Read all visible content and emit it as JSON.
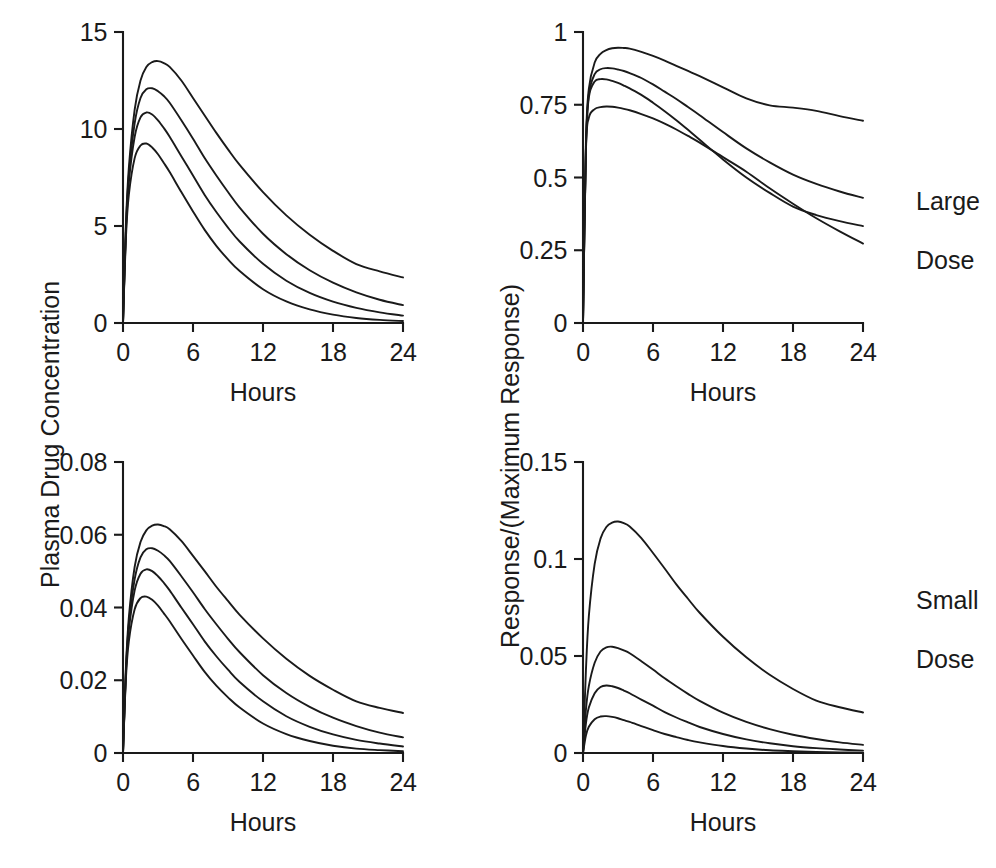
{
  "figure": {
    "background": "#ffffff",
    "ink_color": "#1a1a1a",
    "left_axis_title": "Plasma Drug Concentration",
    "right_axis_title": "Response/(Maximum Response)",
    "row_labels": [
      {
        "line1": "Large",
        "line2": "Dose"
      },
      {
        "line1": "Small",
        "line2": "Dose"
      }
    ]
  },
  "chart_data": [
    {
      "id": "top-left",
      "type": "line",
      "title": "",
      "xlabel": "Hours",
      "ylabel": "Plasma Drug Concentration",
      "xlim": [
        0,
        24
      ],
      "ylim": [
        0,
        15
      ],
      "xticks": [
        0,
        6,
        12,
        18,
        24
      ],
      "xticklabels": [
        "0",
        "6",
        "12",
        "18",
        "24"
      ],
      "yticks": [
        0,
        5,
        10,
        15
      ],
      "yticklabels": [
        "0",
        "5",
        "10",
        "15"
      ],
      "grid": false,
      "legend": "none",
      "x": [
        0,
        0.25,
        0.5,
        1,
        1.5,
        2,
        2.5,
        3,
        3.5,
        4,
        5,
        6,
        7,
        8,
        9,
        10,
        12,
        14,
        16,
        18,
        20,
        22,
        24
      ],
      "series": [
        {
          "name": "slowest elimination",
          "values": [
            0,
            5.1,
            8.0,
            11.0,
            12.5,
            13.2,
            13.45,
            13.5,
            13.4,
            13.2,
            12.5,
            11.6,
            10.7,
            9.8,
            8.95,
            8.15,
            6.75,
            5.55,
            4.55,
            3.72,
            3.04,
            2.66,
            2.35
          ]
        },
        {
          "name": "slow elimination",
          "values": [
            0,
            4.9,
            7.6,
            10.3,
            11.6,
            12.05,
            12.1,
            11.95,
            11.7,
            11.35,
            10.45,
            9.5,
            8.5,
            7.6,
            6.75,
            5.95,
            4.6,
            3.55,
            2.72,
            2.08,
            1.58,
            1.2,
            0.92
          ]
        },
        {
          "name": "fast elimination",
          "values": [
            0,
            4.7,
            7.25,
            9.6,
            10.6,
            10.85,
            10.75,
            10.45,
            10.05,
            9.6,
            8.6,
            7.6,
            6.6,
            5.72,
            4.92,
            4.2,
            3.05,
            2.18,
            1.55,
            1.1,
            0.78,
            0.55,
            0.38
          ]
        },
        {
          "name": "fastest elimination",
          "values": [
            0,
            4.4,
            6.6,
            8.5,
            9.15,
            9.25,
            9.05,
            8.7,
            8.25,
            7.78,
            6.75,
            5.75,
            4.8,
            3.98,
            3.28,
            2.68,
            1.74,
            1.11,
            0.7,
            0.43,
            0.26,
            0.16,
            0.1
          ]
        }
      ]
    },
    {
      "id": "top-right",
      "type": "line",
      "title": "",
      "xlabel": "Hours",
      "ylabel": "Response/(Maximum Response)",
      "xlim": [
        0,
        24
      ],
      "ylim": [
        0,
        1
      ],
      "xticks": [
        0,
        6,
        12,
        18,
        24
      ],
      "xticklabels": [
        "0",
        "6",
        "12",
        "18",
        "24"
      ],
      "yticks": [
        0,
        0.25,
        0.5,
        0.75,
        1
      ],
      "yticklabels": [
        "0",
        "0.25",
        "0.5",
        "0.75",
        "1"
      ],
      "grid": false,
      "legend": "none",
      "row_label": "Large Dose",
      "x": [
        0,
        0.25,
        0.5,
        1,
        1.5,
        2,
        2.5,
        3,
        3.5,
        4,
        5,
        6,
        7,
        8,
        9,
        10,
        12,
        14,
        16,
        18,
        20,
        22,
        24
      ],
      "series": [
        {
          "name": "slowest elimination",
          "values": [
            0,
            0.62,
            0.805,
            0.895,
            0.925,
            0.938,
            0.944,
            0.946,
            0.945,
            0.943,
            0.932,
            0.918,
            0.902,
            0.884,
            0.866,
            0.848,
            0.81,
            0.772,
            0.748,
            0.74,
            0.729,
            0.711,
            0.695
          ]
        },
        {
          "name": "slow elimination",
          "values": [
            0,
            0.605,
            0.785,
            0.855,
            0.872,
            0.876,
            0.875,
            0.871,
            0.866,
            0.859,
            0.842,
            0.82,
            0.795,
            0.77,
            0.742,
            0.714,
            0.656,
            0.6,
            0.552,
            0.51,
            0.478,
            0.452,
            0.43
          ]
        },
        {
          "name": "fast elimination",
          "values": [
            0,
            0.6,
            0.775,
            0.83,
            0.838,
            0.837,
            0.832,
            0.825,
            0.816,
            0.806,
            0.784,
            0.757,
            0.728,
            0.697,
            0.664,
            0.63,
            0.562,
            0.5,
            0.447,
            0.4,
            0.371,
            0.35,
            0.333
          ]
        },
        {
          "name": "fastest elimination",
          "values": [
            0,
            0.59,
            0.705,
            0.735,
            0.742,
            0.744,
            0.743,
            0.74,
            0.736,
            0.731,
            0.718,
            0.703,
            0.685,
            0.665,
            0.643,
            0.62,
            0.57,
            0.52,
            0.463,
            0.41,
            0.36,
            0.315,
            0.273
          ]
        }
      ]
    },
    {
      "id": "bottom-left",
      "type": "line",
      "title": "",
      "xlabel": "Hours",
      "ylabel": "Plasma Drug Concentration",
      "xlim": [
        0,
        24
      ],
      "ylim": [
        0,
        0.08
      ],
      "xticks": [
        0,
        6,
        12,
        18,
        24
      ],
      "xticklabels": [
        "0",
        "6",
        "12",
        "18",
        "24"
      ],
      "yticks": [
        0,
        0.02,
        0.04,
        0.06,
        0.08
      ],
      "yticklabels": [
        "0",
        "0.02",
        "0.04",
        "0.06",
        "0.08"
      ],
      "grid": false,
      "legend": "none",
      "x": [
        0,
        0.25,
        0.5,
        1,
        1.5,
        2,
        2.5,
        3,
        3.5,
        4,
        5,
        6,
        7,
        8,
        9,
        10,
        12,
        14,
        16,
        18,
        20,
        22,
        24
      ],
      "series": [
        {
          "name": "slowest elimination",
          "values": [
            0,
            0.0235,
            0.0372,
            0.0512,
            0.058,
            0.0612,
            0.0625,
            0.0628,
            0.0624,
            0.0615,
            0.0583,
            0.0542,
            0.05,
            0.0457,
            0.0418,
            0.038,
            0.0315,
            0.0259,
            0.0212,
            0.0174,
            0.0142,
            0.0124,
            0.011
          ]
        },
        {
          "name": "slow elimination",
          "values": [
            0,
            0.0228,
            0.0354,
            0.0478,
            0.0538,
            0.056,
            0.0563,
            0.0556,
            0.0544,
            0.0528,
            0.0486,
            0.0442,
            0.0396,
            0.0354,
            0.0314,
            0.0277,
            0.0214,
            0.0165,
            0.0127,
            0.0097,
            0.0074,
            0.0056,
            0.0043
          ]
        },
        {
          "name": "fast elimination",
          "values": [
            0,
            0.0219,
            0.0337,
            0.0447,
            0.0493,
            0.0505,
            0.05,
            0.0486,
            0.0468,
            0.0447,
            0.04,
            0.0354,
            0.0307,
            0.0266,
            0.0229,
            0.0195,
            0.0142,
            0.0101,
            0.0072,
            0.0051,
            0.0036,
            0.0026,
            0.0018
          ]
        },
        {
          "name": "fastest elimination",
          "values": [
            0,
            0.0205,
            0.0307,
            0.0395,
            0.0426,
            0.043,
            0.0421,
            0.0405,
            0.0384,
            0.0362,
            0.0314,
            0.0268,
            0.0223,
            0.0185,
            0.0153,
            0.0125,
            0.0081,
            0.0052,
            0.0033,
            0.002,
            0.0012,
            0.0008,
            0.0005
          ]
        }
      ]
    },
    {
      "id": "bottom-right",
      "type": "line",
      "title": "",
      "xlabel": "Hours",
      "ylabel": "Response/(Maximum Response)",
      "xlim": [
        0,
        24
      ],
      "ylim": [
        0,
        0.15
      ],
      "xticks": [
        0,
        6,
        12,
        18,
        24
      ],
      "xticklabels": [
        "0",
        "6",
        "12",
        "18",
        "24"
      ],
      "yticks": [
        0,
        0.05,
        0.1,
        0.15
      ],
      "yticklabels": [
        "0",
        "0.05",
        "0.1",
        "0.15"
      ],
      "grid": false,
      "legend": "none",
      "row_label": "Small Dose",
      "x": [
        0,
        0.25,
        0.5,
        1,
        1.5,
        2,
        2.5,
        3,
        3.5,
        4,
        5,
        6,
        7,
        8,
        9,
        10,
        12,
        14,
        16,
        18,
        20,
        22,
        24
      ],
      "series": [
        {
          "name": "slowest elimination",
          "values": [
            0,
            0.0425,
            0.0705,
            0.0975,
            0.1105,
            0.1165,
            0.1188,
            0.1193,
            0.1185,
            0.1168,
            0.1108,
            0.1031,
            0.0951,
            0.0869,
            0.0795,
            0.0723,
            0.0599,
            0.0493,
            0.0403,
            0.033,
            0.027,
            0.0236,
            0.0209
          ]
        },
        {
          "name": "slow elimination",
          "values": [
            0,
            0.0222,
            0.0345,
            0.0465,
            0.0523,
            0.0545,
            0.0548,
            0.0541,
            0.0529,
            0.0514,
            0.0473,
            0.043,
            0.0385,
            0.0344,
            0.0305,
            0.0269,
            0.0208,
            0.016,
            0.0123,
            0.0094,
            0.0072,
            0.0055,
            0.0042
          ]
        },
        {
          "name": "fast elimination",
          "values": [
            0,
            0.0152,
            0.0234,
            0.0308,
            0.034,
            0.0348,
            0.0344,
            0.0335,
            0.0322,
            0.0308,
            0.0275,
            0.0244,
            0.0211,
            0.0183,
            0.0158,
            0.0134,
            0.0098,
            0.007,
            0.005,
            0.0035,
            0.0025,
            0.0018,
            0.0012
          ]
        },
        {
          "name": "fastest elimination",
          "values": [
            0,
            0.009,
            0.0135,
            0.0174,
            0.0188,
            0.019,
            0.0186,
            0.0179,
            0.0169,
            0.016,
            0.0139,
            0.0118,
            0.0098,
            0.0082,
            0.0067,
            0.0055,
            0.0036,
            0.0023,
            0.0014,
            0.0009,
            0.0005,
            0.0003,
            0.0002
          ]
        }
      ]
    }
  ]
}
